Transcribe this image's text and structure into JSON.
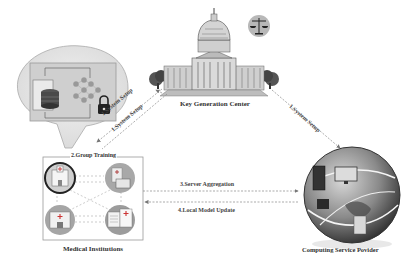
{
  "nodes": {
    "kgc": {
      "label": "Key Generation Center"
    },
    "mi": {
      "label": "Medical Institutions",
      "group_label": "2.Group Training"
    },
    "csp": {
      "label": "Computing Service Povider"
    }
  },
  "edges": {
    "setup_kgc_mi_a": "1.System Setup",
    "setup_kgc_mi_b": "1.System Setup",
    "setup_kgc_csp": "1.System Setup",
    "server_aggregation": "3.Server Aggregation",
    "local_model_update": "4.Local Model Update"
  },
  "colors": {
    "line": "#888888",
    "gray_light": "#e2e2e2",
    "gray_mid": "#9a9a9a",
    "gray_dark": "#3a3a3a"
  }
}
